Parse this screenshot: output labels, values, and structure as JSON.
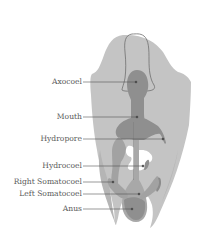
{
  "diagram": {
    "colors": {
      "body": "#c4c4c4",
      "body_dark": "#a8a8a8",
      "organ": "#8f8f8f",
      "organ_dark": "#7a7a7a",
      "outline": "#6e6e6e",
      "leader": "#555555",
      "background": "#ffffff"
    },
    "labels": [
      {
        "id": "axocoel",
        "text": "Axocoel"
      },
      {
        "id": "mouth",
        "text": "Mouth"
      },
      {
        "id": "hydropore",
        "text": "Hydropore"
      },
      {
        "id": "hydrocoel",
        "text": "Hydrocoel"
      },
      {
        "id": "right-somatocoel",
        "text": "Right Somatocoel"
      },
      {
        "id": "left-somatocoel",
        "text": "Left Somatocoel"
      },
      {
        "id": "anus",
        "text": "Anus"
      }
    ]
  }
}
